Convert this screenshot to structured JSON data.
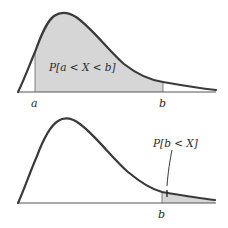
{
  "colors": {
    "curve": "#3a3a3a",
    "shade": "#d6d6d6",
    "axis": "#555555",
    "text": "#2a2a2a"
  },
  "top_panel": {
    "region_label": "P[a < X < b]",
    "tick_a": "a",
    "tick_b": "b"
  },
  "bottom_panel": {
    "region_label": "P[b < X]",
    "tick_b": "b"
  }
}
